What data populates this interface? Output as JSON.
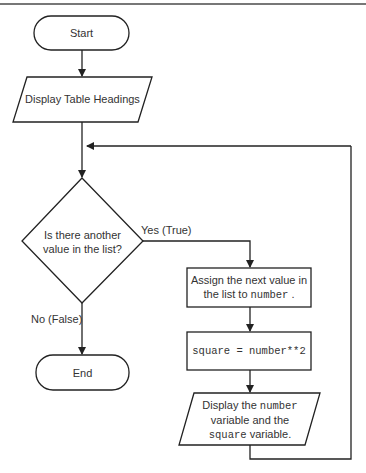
{
  "diagram": {
    "type": "flowchart",
    "nodes": {
      "start": {
        "shape": "terminator",
        "label": "Start"
      },
      "display_headings": {
        "shape": "parallelogram",
        "label": "Display Table Headings"
      },
      "decision": {
        "shape": "diamond",
        "line1": "Is there another",
        "line2": "value in the list?"
      },
      "assign": {
        "shape": "rectangle",
        "line1": "Assign the next value in",
        "line2_prefix": "the list to ",
        "line2_code": "number",
        "line2_suffix": " ."
      },
      "square": {
        "shape": "rectangle",
        "code": "square = number**2"
      },
      "display_vars": {
        "shape": "parallelogram",
        "line1_prefix": "Display the ",
        "line1_code": "number",
        "line2": "variable and the",
        "line3_code": "square",
        "line3_suffix": " variable."
      },
      "end": {
        "shape": "terminator",
        "label": "End"
      }
    },
    "edges": {
      "yes_label": "Yes (True)",
      "no_label": "No (False)"
    },
    "colors": {
      "stroke": "#222222",
      "background": "#ffffff",
      "top_rule": "#777777"
    }
  }
}
